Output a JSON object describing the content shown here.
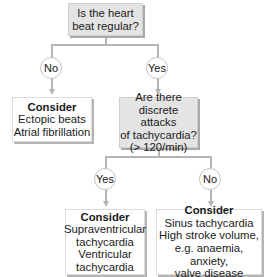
{
  "diagram": {
    "root": {
      "question": [
        "Is the heart",
        "beat regular?"
      ]
    },
    "branch_no": {
      "label": "No",
      "result": {
        "title": "Consider",
        "items": [
          "Ectopic beats",
          "Atrial fibrillation"
        ]
      }
    },
    "branch_yes": {
      "label": "Yes",
      "question": [
        "Are there",
        "discrete attacks",
        "of tachycardia?",
        "(> 120/min)"
      ],
      "sub_yes": {
        "label": "Yes",
        "result": {
          "title": "Consider",
          "items": [
            "Supraventricular",
            "tachycardia",
            "Ventricular",
            "tachycardia"
          ]
        }
      },
      "sub_no": {
        "label": "No",
        "result": {
          "title": "Consider",
          "items": [
            "Sinus tachycardia",
            "High stroke volume,",
            "e.g. anaemia, anxiety,",
            "valve disease"
          ]
        }
      }
    },
    "colors": {
      "question_box": "#e4e4e4",
      "result_box": "#ffffff",
      "connector": "#b4b4b4"
    }
  }
}
